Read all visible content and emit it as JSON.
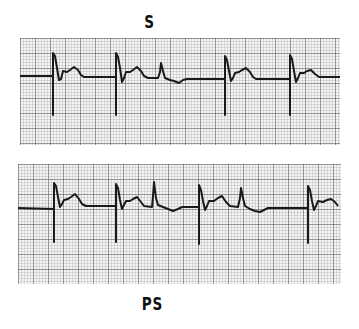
{
  "top_strip": {
    "label": "S",
    "beats": [
      {
        "x": 53,
        "type": "normal"
      },
      {
        "x": 116,
        "type": "normal",
        "followed_by_early_beat_x": 161
      },
      {
        "x": 224,
        "type": "normal"
      },
      {
        "x": 290,
        "type": "normal"
      }
    ]
  },
  "bottom_strip": {
    "label": "PS",
    "beats": [
      {
        "x": 54,
        "type": "normal"
      },
      {
        "x": 117,
        "type": "normal",
        "followed_by_early_beat_x": 155
      },
      {
        "x": 200,
        "type": "normal",
        "followed_by_early_beat_x": 245
      },
      {
        "x": 310,
        "type": "normal"
      }
    ]
  },
  "colors": {
    "grid_minor": "#9a9a9a",
    "grid_major": "#4a4a4a",
    "trace": "#1a1a1a",
    "paper": "#f4f4f4"
  }
}
